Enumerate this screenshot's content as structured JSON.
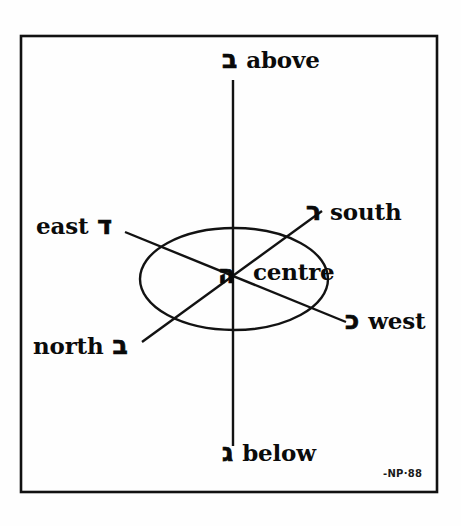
{
  "figure": {
    "signature": "-NP·88",
    "frame_color": "#111111",
    "ink_color": "#0d0d0d",
    "background_color": "#fefefe",
    "directions": [
      {
        "id": "above",
        "english": "above",
        "hebrew": "ב",
        "position": "top"
      },
      {
        "id": "below",
        "english": "below",
        "hebrew": "ג",
        "position": "bottom"
      },
      {
        "id": "east",
        "english": "east",
        "hebrew": "ד",
        "position": "upper-left"
      },
      {
        "id": "south",
        "english": "south",
        "hebrew": "ר",
        "position": "upper-right"
      },
      {
        "id": "west",
        "english": "west",
        "hebrew": "כ",
        "position": "lower-right"
      },
      {
        "id": "north",
        "english": "north",
        "hebrew": "ב",
        "position": "lower-left"
      },
      {
        "id": "centre",
        "english": "centre",
        "hebrew": "ה",
        "position": "centre"
      }
    ],
    "geometry": {
      "frame": {
        "x": 21,
        "y": 36,
        "width": 416,
        "height": 456
      },
      "ellipse": {
        "cx": 234,
        "cy": 279,
        "rx": 94,
        "ry": 51
      },
      "vertical_axis": {
        "x": 233,
        "y1": 80,
        "y2": 446
      },
      "diagonal_east_west": {
        "x1": 125,
        "y1": 232,
        "x2": 345,
        "y2": 322
      },
      "diagonal_north_south": {
        "x1": 142,
        "y1": 341,
        "x2": 322,
        "y2": 212
      }
    }
  }
}
